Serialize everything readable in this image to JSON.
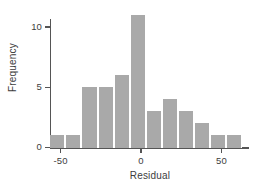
{
  "chart_data": {
    "type": "bar",
    "title": "",
    "subtitle": "",
    "xlabel": "Residual",
    "ylabel": "Frequency",
    "xlim": [
      -62,
      64
    ],
    "ylim": [
      0,
      11.6
    ],
    "grid": false,
    "legend": null,
    "bar_color": "#a9a9a9",
    "axis_color": "#555555",
    "bin_width": 10,
    "bin_starts": [
      -57,
      -47,
      -37,
      -27,
      -17,
      -7,
      3,
      13,
      23,
      33,
      43,
      53
    ],
    "categories": [
      "-57 to -47",
      "-47 to -37",
      "-37 to -27",
      "-27 to -17",
      "-17 to -7",
      "-7 to 3",
      "3 to 13",
      "13 to 23",
      "23 to 33",
      "33 to 43",
      "43 to 53",
      "53 to 63"
    ],
    "values": [
      1,
      1,
      5,
      5,
      6,
      11,
      3,
      4,
      3,
      2,
      1,
      1
    ],
    "xticks": [
      -50,
      0,
      50
    ],
    "xticklabels": [
      "-50",
      "0",
      "50"
    ],
    "yticks": [
      0,
      5,
      10
    ],
    "yticklabels": [
      "0",
      "5",
      "10"
    ]
  }
}
